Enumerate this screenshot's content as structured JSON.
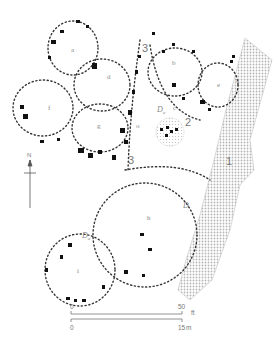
{
  "figure": {
    "type": "archaeological site plan",
    "colors": {
      "posthole": "#111111",
      "outline": "#333333",
      "hatch": "#bdbdbd",
      "label": "#888888"
    }
  },
  "structures": [
    {
      "label": "a",
      "x": 71,
      "y": 52
    },
    {
      "label": "b",
      "x": 172,
      "y": 65
    },
    {
      "label": "c",
      "x": 173,
      "y": 110
    },
    {
      "label": "d",
      "x": 107,
      "y": 79
    },
    {
      "label": "e",
      "x": 217,
      "y": 87
    },
    {
      "label": "f",
      "x": 48,
      "y": 110
    },
    {
      "label": "g",
      "x": 97,
      "y": 128
    },
    {
      "label": "h",
      "x": 147,
      "y": 220
    },
    {
      "label": "i",
      "x": 77,
      "y": 273
    },
    {
      "label": "o",
      "x": 136,
      "y": 128
    },
    {
      "label": "a",
      "x": 236,
      "y": 82
    }
  ],
  "features": [
    {
      "label": "1",
      "x": 226,
      "y": 165
    },
    {
      "label": "2",
      "x": 185,
      "y": 126
    },
    {
      "label": "3",
      "x": 142,
      "y": 52
    },
    {
      "label": "3",
      "x": 128,
      "y": 164
    }
  ],
  "markers": [
    {
      "label": "D",
      "sub": "a",
      "x": 157,
      "y": 112
    },
    {
      "label": "D",
      "sub": "",
      "x": 183,
      "y": 208
    },
    {
      "label": "D",
      "sub": "a",
      "x": 82,
      "y": 238
    }
  ],
  "north_arrow": {
    "label": "N"
  },
  "scale_bars": [
    {
      "start": "0",
      "end": "50",
      "unit": "ft"
    },
    {
      "start": "0",
      "end": "15",
      "unit": "m"
    }
  ]
}
